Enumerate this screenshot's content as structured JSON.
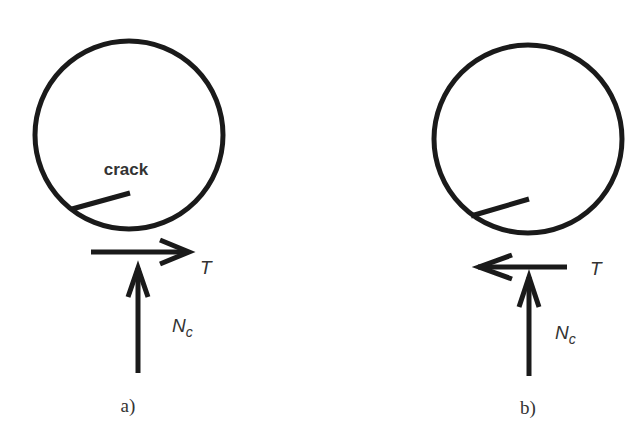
{
  "figure": {
    "panels": [
      {
        "id": "a",
        "caption": "a)",
        "crack_label": "crack",
        "tangential_force": {
          "label": "T",
          "direction": "right"
        },
        "normal_force": {
          "label": "N",
          "subscript": "c",
          "direction": "up"
        }
      },
      {
        "id": "b",
        "caption": "b)",
        "crack_label": "",
        "tangential_force": {
          "label": "T",
          "direction": "left"
        },
        "normal_force": {
          "label": "N",
          "subscript": "c",
          "direction": "up"
        }
      }
    ]
  },
  "colors": {
    "stroke": "#1a1a1a",
    "label": "#333333",
    "background": "#ffffff"
  }
}
